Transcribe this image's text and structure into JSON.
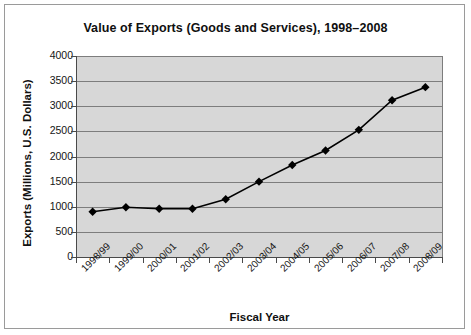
{
  "chart_data": {
    "type": "line",
    "title": "Value of Exports (Goods and Services), 1998–2008",
    "xlabel": "Fiscal Year",
    "ylabel": "Exports (Millions, U.S. Dollars)",
    "categories": [
      "1998/99",
      "1999/00",
      "2000/01",
      "2001/02",
      "2002/03",
      "2003/04",
      "2004/05",
      "2005/06",
      "2006/07",
      "2007/08",
      "2008/09"
    ],
    "values": [
      900,
      990,
      960,
      960,
      1150,
      1500,
      1830,
      2120,
      2530,
      3120,
      3380
    ],
    "series": [
      {
        "name": "Exports",
        "values": [
          900,
          990,
          960,
          960,
          1150,
          1500,
          1830,
          2120,
          2530,
          3120,
          3380
        ]
      }
    ],
    "ylim": [
      0,
      4000
    ],
    "yticks": [
      0,
      500,
      1000,
      1500,
      2000,
      2500,
      3000,
      3500,
      4000
    ],
    "ytick_labels": [
      "0",
      "500",
      "1000",
      "1500",
      "2000",
      "2500",
      "3000",
      "3500",
      "4000"
    ],
    "grid": true,
    "legend": "none",
    "marker": "diamond",
    "line_color": "#000000",
    "marker_color": "#000000",
    "plot_background": "#d7d7d7",
    "gridline_color": "#7d7d7d",
    "figure_background": "#ffffff"
  }
}
